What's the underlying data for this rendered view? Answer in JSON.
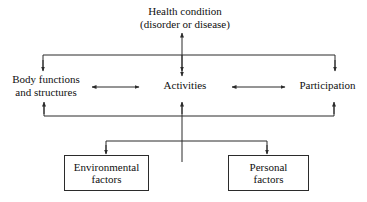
{
  "diagram": {
    "line_color": "#2b2b2b",
    "background": "#ffffff",
    "nodes": {
      "health_condition": {
        "line1": "Health condition",
        "line2": "(disorder or disease)"
      },
      "body_functions": {
        "line1": "Body functions",
        "line2": "and structures"
      },
      "activities": {
        "line1": "Activities"
      },
      "participation": {
        "line1": "Participation"
      },
      "environmental_factors": {
        "line1": "Environmental",
        "line2": "factors"
      },
      "personal_factors": {
        "line1": "Personal",
        "line2": "factors"
      }
    }
  }
}
